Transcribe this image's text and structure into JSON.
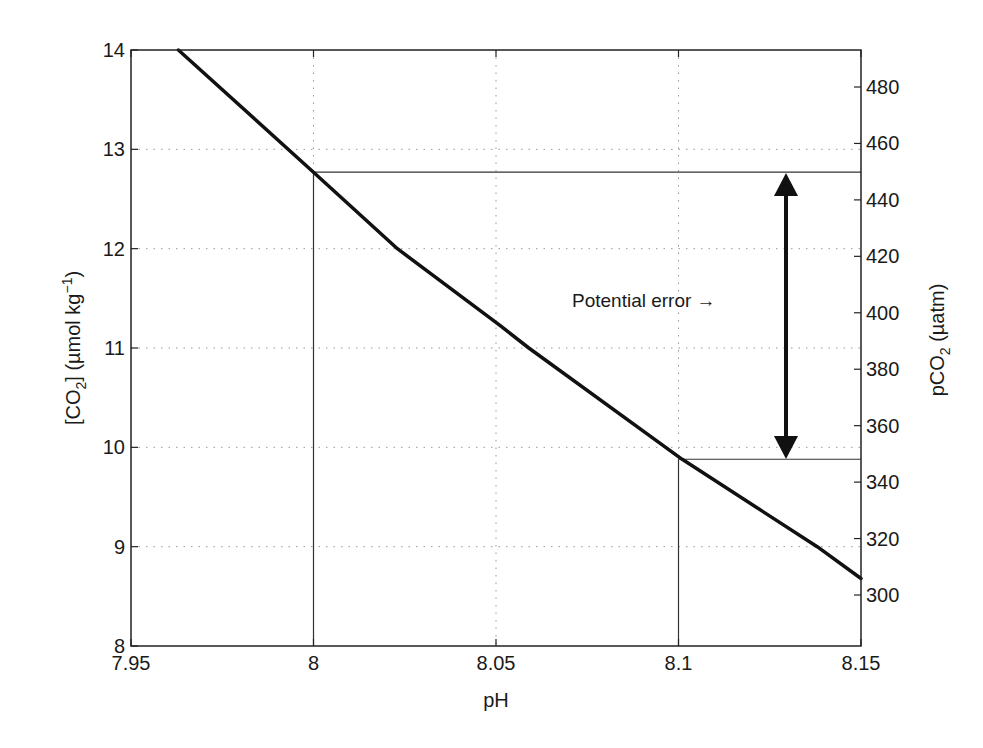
{
  "chart_data": {
    "type": "line",
    "title": "",
    "xlabel": "pH",
    "ylabel": "[CO2] (µmol kg−1)",
    "ylabel_right": "pCO2 (µatm)",
    "xlim": [
      7.95,
      8.15
    ],
    "ylim": [
      8,
      14
    ],
    "ylim_right": [
      285,
      495
    ],
    "x_ticks": [
      "7.95",
      "8",
      "8.05",
      "8.1",
      "8.15"
    ],
    "y_ticks": [
      "8",
      "9",
      "10",
      "11",
      "12",
      "13",
      "14"
    ],
    "y_right_ticks": [
      "300",
      "320",
      "340",
      "360",
      "380",
      "400",
      "420",
      "440",
      "460",
      "480"
    ],
    "grid": "dotted",
    "series": [
      {
        "name": "[CO2] vs pH",
        "x": [
          7.963,
          8.0,
          8.023,
          8.051,
          8.059,
          8.101,
          8.138,
          8.15
        ],
        "y": [
          14.0,
          12.77,
          12.0,
          11.23,
          11.0,
          9.88,
          9.0,
          8.68
        ]
      }
    ],
    "reference_lines": [
      {
        "type": "vertical",
        "x": 8.0,
        "from_y": 8,
        "to_y": 12.77
      },
      {
        "type": "horizontal",
        "y": 12.77,
        "from_x": 8.0,
        "to_x": 8.15,
        "pco2": 450
      },
      {
        "type": "vertical",
        "x": 8.1,
        "from_y": 8,
        "to_y": 9.88
      },
      {
        "type": "horizontal",
        "y": 9.88,
        "from_x": 8.1,
        "to_x": 8.15,
        "pco2": 348
      }
    ],
    "annotations": [
      {
        "text": "Potential error →",
        "type": "double-arrow",
        "x": 8.13,
        "y_from": 9.88,
        "y_to": 12.77
      }
    ]
  },
  "labels": {
    "xlabel": "pH",
    "ylabel_main": "[CO",
    "ylabel_sub": "2",
    "ylabel_rest": "] (µmol kg",
    "ylabel_sup": "−1",
    "ylabel_close": ")",
    "ylabel_right_main": "pCO",
    "ylabel_right_sub": "2",
    "ylabel_right_rest": " (µatm)",
    "annotation": "Potential error →"
  }
}
